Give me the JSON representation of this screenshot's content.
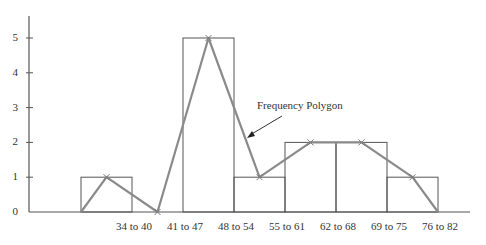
{
  "chart_data": {
    "type": "bar",
    "subtype": "histogram with frequency polygon overlay",
    "title": "",
    "xlabel": "",
    "ylabel": "",
    "categories": [
      "34 to 40",
      "41 to 47",
      "48 to 54",
      "55 to 61",
      "62 to 68",
      "69 to 75",
      "76 to 82"
    ],
    "values": [
      1,
      0,
      5,
      1,
      2,
      2,
      1
    ],
    "series": [
      {
        "name": "Histogram",
        "type": "bar",
        "values": [
          1,
          0,
          5,
          1,
          2,
          2,
          1
        ]
      },
      {
        "name": "Frequency Polygon",
        "type": "line",
        "x": [
          "(lower bound)",
          "34 to 40",
          "41 to 47",
          "48 to 54",
          "55 to 61",
          "62 to 68",
          "69 to 75",
          "76 to 82",
          "(upper bound)"
        ],
        "values": [
          0,
          1,
          0,
          5,
          1,
          2,
          2,
          1,
          0
        ]
      }
    ],
    "yticks": [
      "0",
      "1",
      "2",
      "3",
      "4",
      "5"
    ],
    "ylim": [
      0,
      5.5
    ],
    "grid": false,
    "legend": "none",
    "annotations": [
      {
        "text": "Frequency Polygon",
        "arrow_to": "polygon segment between 48 to 54 and 55 to 61"
      }
    ],
    "colors": {
      "bars_outline": "#555555",
      "polygon": "#8a8a8a",
      "axis": "#555555"
    }
  }
}
